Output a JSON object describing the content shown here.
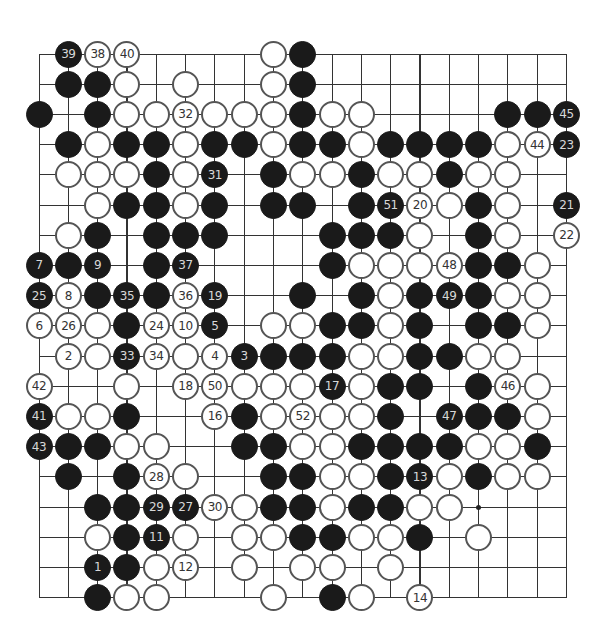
{
  "board": {
    "size": 19,
    "origin_x": 39,
    "origin_y": 54,
    "step_x": 29.3,
    "step_y": 30.2,
    "colors": {
      "black": "#1a1a1a",
      "white": "#ffffff",
      "line": "#333333"
    },
    "star_points": [
      [
        15,
        15
      ]
    ],
    "rows": [
      [
        [
          1,
          "B",
          "39"
        ],
        [
          2,
          "W",
          "38"
        ],
        [
          3,
          "W",
          "40"
        ],
        [
          8,
          "W",
          ""
        ],
        [
          9,
          "B",
          ""
        ]
      ],
      [
        [
          1,
          "B",
          ""
        ],
        [
          2,
          "B",
          ""
        ],
        [
          3,
          "W",
          ""
        ],
        [
          5,
          "W",
          ""
        ],
        [
          8,
          "W",
          ""
        ],
        [
          9,
          "B",
          ""
        ]
      ],
      [
        [
          0,
          "B",
          ""
        ],
        [
          2,
          "B",
          ""
        ],
        [
          3,
          "W",
          ""
        ],
        [
          4,
          "W",
          ""
        ],
        [
          5,
          "W",
          "32"
        ],
        [
          6,
          "W",
          ""
        ],
        [
          7,
          "W",
          ""
        ],
        [
          8,
          "W",
          ""
        ],
        [
          9,
          "B",
          ""
        ],
        [
          10,
          "W",
          ""
        ],
        [
          11,
          "W",
          ""
        ],
        [
          16,
          "B",
          ""
        ],
        [
          17,
          "B",
          ""
        ],
        [
          18,
          "B",
          "45"
        ]
      ],
      [
        [
          1,
          "B",
          ""
        ],
        [
          2,
          "W",
          ""
        ],
        [
          3,
          "B",
          ""
        ],
        [
          4,
          "B",
          ""
        ],
        [
          5,
          "W",
          ""
        ],
        [
          6,
          "B",
          ""
        ],
        [
          7,
          "B",
          ""
        ],
        [
          8,
          "W",
          ""
        ],
        [
          9,
          "B",
          ""
        ],
        [
          10,
          "B",
          ""
        ],
        [
          11,
          "W",
          ""
        ],
        [
          12,
          "B",
          ""
        ],
        [
          13,
          "B",
          ""
        ],
        [
          14,
          "B",
          ""
        ],
        [
          15,
          "B",
          ""
        ],
        [
          16,
          "W",
          ""
        ],
        [
          17,
          "W",
          "44"
        ],
        [
          18,
          "B",
          "23"
        ]
      ],
      [
        [
          1,
          "W",
          ""
        ],
        [
          2,
          "W",
          ""
        ],
        [
          3,
          "W",
          ""
        ],
        [
          4,
          "B",
          ""
        ],
        [
          5,
          "W",
          ""
        ],
        [
          6,
          "B",
          "31"
        ],
        [
          8,
          "B",
          ""
        ],
        [
          9,
          "W",
          ""
        ],
        [
          10,
          "W",
          ""
        ],
        [
          11,
          "B",
          ""
        ],
        [
          12,
          "W",
          ""
        ],
        [
          13,
          "W",
          ""
        ],
        [
          14,
          "B",
          ""
        ],
        [
          15,
          "W",
          ""
        ],
        [
          16,
          "W",
          ""
        ]
      ],
      [
        [
          2,
          "W",
          ""
        ],
        [
          3,
          "B",
          ""
        ],
        [
          4,
          "B",
          ""
        ],
        [
          5,
          "W",
          ""
        ],
        [
          6,
          "B",
          ""
        ],
        [
          8,
          "B",
          ""
        ],
        [
          9,
          "B",
          ""
        ],
        [
          11,
          "B",
          ""
        ],
        [
          12,
          "B",
          "51"
        ],
        [
          13,
          "W",
          "20"
        ],
        [
          14,
          "W",
          ""
        ],
        [
          15,
          "B",
          ""
        ],
        [
          16,
          "W",
          ""
        ],
        [
          18,
          "B",
          "21"
        ]
      ],
      [
        [
          1,
          "W",
          ""
        ],
        [
          2,
          "B",
          ""
        ],
        [
          4,
          "B",
          ""
        ],
        [
          5,
          "B",
          ""
        ],
        [
          6,
          "B",
          ""
        ],
        [
          10,
          "B",
          ""
        ],
        [
          11,
          "B",
          ""
        ],
        [
          12,
          "B",
          ""
        ],
        [
          13,
          "W",
          ""
        ],
        [
          15,
          "B",
          ""
        ],
        [
          16,
          "W",
          ""
        ],
        [
          18,
          "W",
          "22"
        ]
      ],
      [
        [
          0,
          "B",
          "7"
        ],
        [
          1,
          "B",
          ""
        ],
        [
          2,
          "B",
          "9"
        ],
        [
          4,
          "B",
          ""
        ],
        [
          5,
          "B",
          "37"
        ],
        [
          10,
          "B",
          ""
        ],
        [
          11,
          "W",
          ""
        ],
        [
          12,
          "W",
          ""
        ],
        [
          13,
          "W",
          ""
        ],
        [
          14,
          "W",
          "48"
        ],
        [
          15,
          "B",
          ""
        ],
        [
          16,
          "B",
          ""
        ],
        [
          17,
          "W",
          ""
        ]
      ],
      [
        [
          0,
          "B",
          "25"
        ],
        [
          1,
          "W",
          "8"
        ],
        [
          2,
          "B",
          ""
        ],
        [
          3,
          "B",
          "35"
        ],
        [
          4,
          "B",
          ""
        ],
        [
          5,
          "W",
          "36"
        ],
        [
          6,
          "B",
          "19"
        ],
        [
          9,
          "B",
          ""
        ],
        [
          11,
          "B",
          ""
        ],
        [
          12,
          "W",
          ""
        ],
        [
          13,
          "B",
          ""
        ],
        [
          14,
          "B",
          "49"
        ],
        [
          15,
          "B",
          ""
        ],
        [
          16,
          "W",
          ""
        ],
        [
          17,
          "W",
          ""
        ]
      ],
      [
        [
          0,
          "W",
          "6"
        ],
        [
          1,
          "W",
          "26"
        ],
        [
          2,
          "W",
          ""
        ],
        [
          3,
          "B",
          ""
        ],
        [
          4,
          "W",
          "24"
        ],
        [
          5,
          "W",
          "10"
        ],
        [
          6,
          "B",
          "5"
        ],
        [
          8,
          "W",
          ""
        ],
        [
          9,
          "W",
          ""
        ],
        [
          10,
          "B",
          ""
        ],
        [
          11,
          "B",
          ""
        ],
        [
          12,
          "W",
          ""
        ],
        [
          13,
          "B",
          ""
        ],
        [
          15,
          "B",
          ""
        ],
        [
          16,
          "B",
          ""
        ],
        [
          17,
          "W",
          ""
        ]
      ],
      [
        [
          1,
          "W",
          "2"
        ],
        [
          2,
          "W",
          ""
        ],
        [
          3,
          "B",
          "33"
        ],
        [
          4,
          "W",
          "34"
        ],
        [
          5,
          "W",
          ""
        ],
        [
          6,
          "W",
          "4"
        ],
        [
          7,
          "B",
          "3"
        ],
        [
          8,
          "B",
          ""
        ],
        [
          9,
          "B",
          ""
        ],
        [
          10,
          "B",
          ""
        ],
        [
          11,
          "W",
          ""
        ],
        [
          12,
          "W",
          ""
        ],
        [
          13,
          "B",
          ""
        ],
        [
          14,
          "B",
          ""
        ],
        [
          15,
          "W",
          ""
        ],
        [
          16,
          "W",
          ""
        ]
      ],
      [
        [
          0,
          "W",
          "42"
        ],
        [
          3,
          "W",
          ""
        ],
        [
          5,
          "W",
          "18"
        ],
        [
          6,
          "W",
          "50"
        ],
        [
          7,
          "W",
          ""
        ],
        [
          8,
          "W",
          ""
        ],
        [
          9,
          "W",
          ""
        ],
        [
          10,
          "B",
          "17"
        ],
        [
          11,
          "W",
          ""
        ],
        [
          12,
          "B",
          ""
        ],
        [
          13,
          "B",
          ""
        ],
        [
          15,
          "B",
          ""
        ],
        [
          16,
          "W",
          "46"
        ],
        [
          17,
          "W",
          ""
        ]
      ],
      [
        [
          0,
          "B",
          "41"
        ],
        [
          1,
          "W",
          ""
        ],
        [
          2,
          "W",
          ""
        ],
        [
          3,
          "B",
          ""
        ],
        [
          6,
          "W",
          "16"
        ],
        [
          7,
          "B",
          ""
        ],
        [
          8,
          "W",
          ""
        ],
        [
          9,
          "W",
          "52"
        ],
        [
          10,
          "W",
          ""
        ],
        [
          11,
          "W",
          ""
        ],
        [
          12,
          "B",
          ""
        ],
        [
          14,
          "B",
          "47"
        ],
        [
          15,
          "B",
          ""
        ],
        [
          16,
          "B",
          ""
        ],
        [
          17,
          "W",
          ""
        ]
      ],
      [
        [
          0,
          "B",
          "43"
        ],
        [
          1,
          "B",
          ""
        ],
        [
          2,
          "B",
          ""
        ],
        [
          3,
          "W",
          ""
        ],
        [
          4,
          "W",
          ""
        ],
        [
          7,
          "B",
          ""
        ],
        [
          8,
          "B",
          ""
        ],
        [
          9,
          "W",
          ""
        ],
        [
          10,
          "W",
          ""
        ],
        [
          11,
          "B",
          ""
        ],
        [
          12,
          "B",
          ""
        ],
        [
          13,
          "B",
          ""
        ],
        [
          14,
          "B",
          ""
        ],
        [
          15,
          "W",
          ""
        ],
        [
          16,
          "W",
          ""
        ],
        [
          17,
          "B",
          ""
        ]
      ],
      [
        [
          1,
          "B",
          ""
        ],
        [
          3,
          "B",
          ""
        ],
        [
          4,
          "W",
          "28"
        ],
        [
          5,
          "W",
          ""
        ],
        [
          8,
          "B",
          ""
        ],
        [
          9,
          "B",
          ""
        ],
        [
          10,
          "W",
          ""
        ],
        [
          11,
          "W",
          ""
        ],
        [
          12,
          "B",
          ""
        ],
        [
          13,
          "B",
          "13"
        ],
        [
          14,
          "W",
          ""
        ],
        [
          15,
          "B",
          ""
        ],
        [
          16,
          "W",
          ""
        ],
        [
          17,
          "W",
          ""
        ]
      ],
      [
        [
          2,
          "B",
          ""
        ],
        [
          3,
          "B",
          ""
        ],
        [
          4,
          "B",
          "29"
        ],
        [
          5,
          "B",
          "27"
        ],
        [
          6,
          "W",
          "30"
        ],
        [
          7,
          "W",
          ""
        ],
        [
          8,
          "B",
          ""
        ],
        [
          9,
          "B",
          ""
        ],
        [
          10,
          "W",
          ""
        ],
        [
          11,
          "B",
          ""
        ],
        [
          12,
          "B",
          ""
        ],
        [
          13,
          "W",
          ""
        ],
        [
          14,
          "W",
          ""
        ]
      ],
      [
        [
          2,
          "W",
          ""
        ],
        [
          3,
          "B",
          ""
        ],
        [
          4,
          "B",
          "11"
        ],
        [
          5,
          "W",
          ""
        ],
        [
          7,
          "W",
          ""
        ],
        [
          8,
          "W",
          ""
        ],
        [
          9,
          "B",
          ""
        ],
        [
          10,
          "B",
          ""
        ],
        [
          11,
          "W",
          ""
        ],
        [
          12,
          "W",
          ""
        ],
        [
          13,
          "B",
          ""
        ],
        [
          15,
          "W",
          ""
        ]
      ],
      [
        [
          2,
          "B",
          "1"
        ],
        [
          3,
          "B",
          ""
        ],
        [
          4,
          "W",
          ""
        ],
        [
          5,
          "W",
          "12"
        ],
        [
          7,
          "W",
          ""
        ],
        [
          9,
          "W",
          ""
        ],
        [
          10,
          "W",
          ""
        ],
        [
          12,
          "W",
          ""
        ]
      ],
      [
        [
          2,
          "B",
          ""
        ],
        [
          3,
          "W",
          ""
        ],
        [
          4,
          "W",
          ""
        ],
        [
          8,
          "W",
          ""
        ],
        [
          10,
          "B",
          ""
        ],
        [
          11,
          "W",
          ""
        ],
        [
          13,
          "W",
          "14"
        ]
      ]
    ]
  }
}
